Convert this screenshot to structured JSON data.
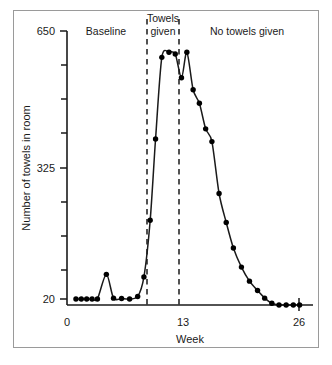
{
  "figure": {
    "frame_visible": true,
    "background_color": "#ffffff",
    "line_color": "#1a1a1a",
    "marker_color": "#000000"
  },
  "chart_data": {
    "type": "line",
    "title": "",
    "subtitle": "",
    "xlabel": "Week",
    "ylabel": "Number of towels in room",
    "xlim": [
      0,
      27.5
    ],
    "ylim": [
      0,
      650
    ],
    "xticks": [
      0,
      13,
      26
    ],
    "xtick_labels": [
      "0",
      "13",
      "26"
    ],
    "yticks": [
      20,
      98,
      176,
      254,
      325,
      406,
      484,
      562,
      650
    ],
    "ytick_labels": [
      "20",
      "",
      "",
      "",
      "325",
      "",
      "",
      "",
      "650"
    ],
    "grid": false,
    "legend": false,
    "legend_position": "none",
    "series": [
      {
        "name": "Number of towels in room",
        "marker": "filled-circle",
        "x": [
          1.0,
          1.6,
          2.2,
          2.8,
          3.4,
          4.4,
          5.2,
          6.1,
          7.0,
          7.9,
          8.6,
          9.3,
          9.9,
          10.6,
          11.4,
          12.1,
          12.8,
          13.4,
          14.1,
          14.8,
          15.5,
          16.2,
          17.0,
          17.8,
          18.6,
          19.5,
          20.4,
          21.3,
          22.1,
          22.9,
          23.7,
          24.5,
          25.3,
          26.0
        ],
        "y": [
          20,
          20,
          20,
          20,
          20,
          78,
          22,
          21,
          20,
          26,
          72,
          205,
          396,
          588,
          600,
          596,
          540,
          600,
          512,
          480,
          420,
          390,
          268,
          200,
          140,
          95,
          62,
          40,
          22,
          10,
          6,
          6,
          6,
          6
        ]
      }
    ],
    "phases": [
      {
        "name": "baseline",
        "label": "Baseline",
        "x_start": 0,
        "x_end": 9.0
      },
      {
        "name": "towels-given",
        "label": "Towels\ngiven",
        "x_start": 9.0,
        "x_end": 12.6
      },
      {
        "name": "no-towels-given",
        "label": "No towels given",
        "x_start": 12.6,
        "x_end": 27.5
      }
    ],
    "phase_lines": {
      "style": "dashed",
      "x_values": [
        9.0,
        12.6
      ]
    },
    "annotations": [
      {
        "name": "baseline-label",
        "text": "Baseline"
      },
      {
        "name": "towels-given-label-line1",
        "text": "Towels"
      },
      {
        "name": "towels-given-label-line2",
        "text": "given"
      },
      {
        "name": "no-towels-given-label",
        "text": "No towels given"
      }
    ]
  },
  "axes": {
    "y_tick_top_label": "650",
    "y_tick_mid_label": "325",
    "y_tick_bottom_label": "20",
    "y_axis_title": "Number of towels in room",
    "x_tick_start_label": "0",
    "x_tick_mid_label": "13",
    "x_tick_end_label": "26",
    "x_axis_title": "Week"
  },
  "phase_labels": {
    "baseline": "Baseline",
    "towels_given_line1": "Towels",
    "towels_given_line2": "given",
    "no_towels_given": "No towels given"
  }
}
